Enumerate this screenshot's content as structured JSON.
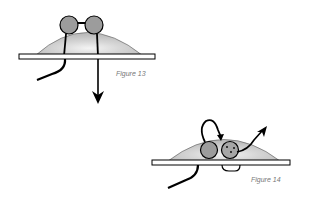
{
  "figures": [
    {
      "id": "fig13",
      "caption": "Figure 13",
      "colors": {
        "dome": "#c8c8c8",
        "dome_highlight": "#f2f2f2",
        "bead": "#9a9a9a",
        "line": "#000000",
        "plank": "#ffffff"
      }
    },
    {
      "id": "fig14",
      "caption": "Figure 14",
      "colors": {
        "dome": "#c8c8c8",
        "dome_highlight": "#f2f2f2",
        "bead": "#9a9a9a",
        "line": "#000000",
        "plank": "#ffffff"
      }
    }
  ]
}
